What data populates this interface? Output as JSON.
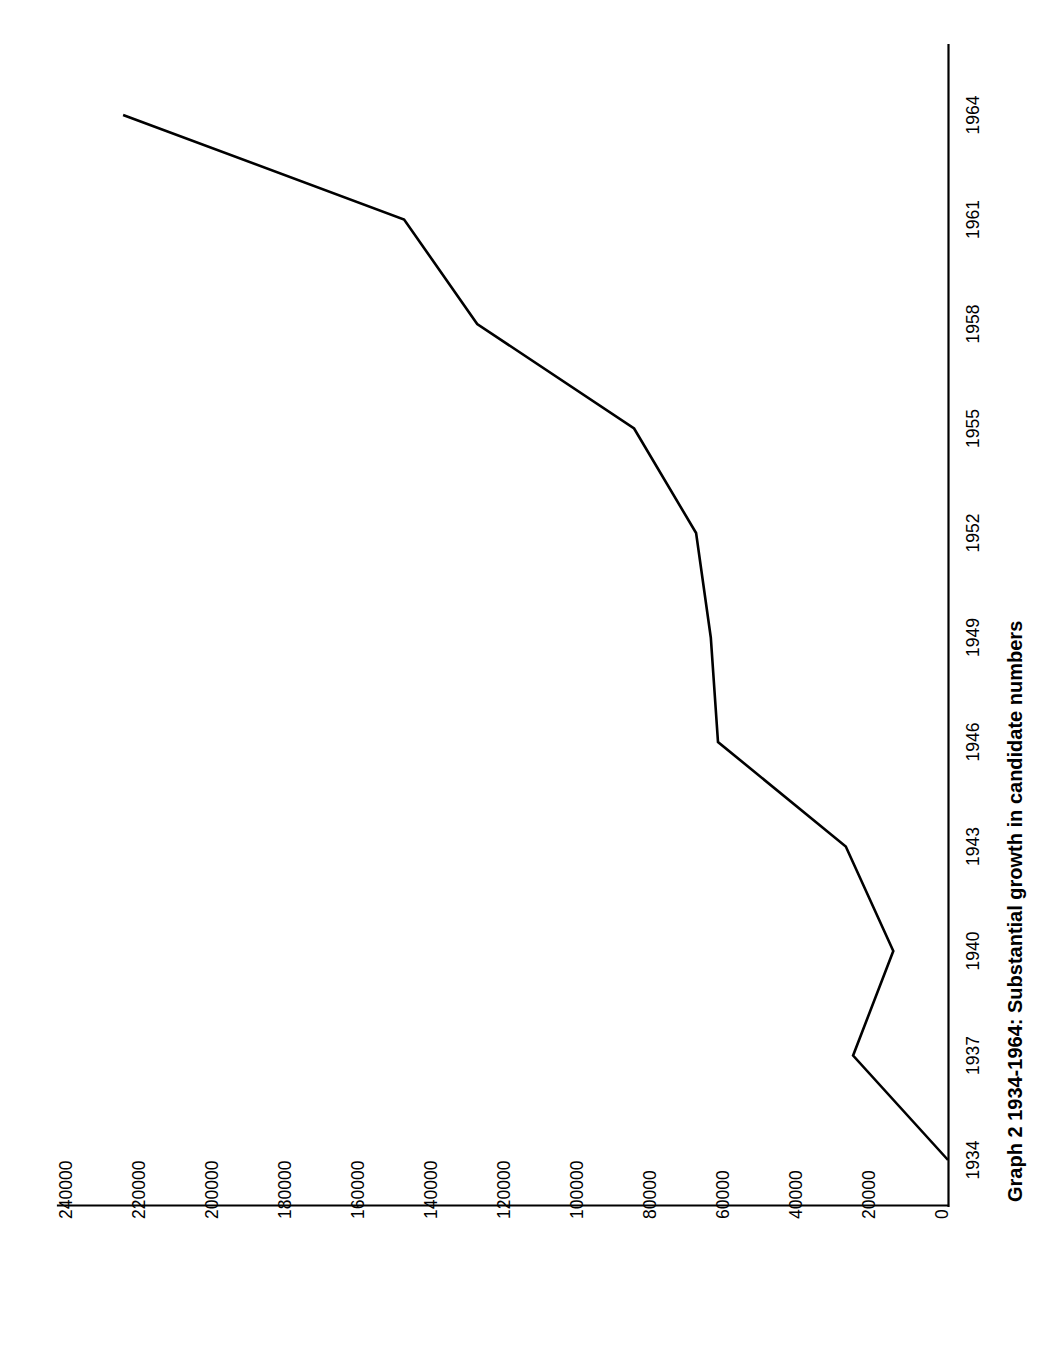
{
  "chart_data": {
    "type": "line",
    "title": "Graph 2 1934-1964: Substantial growth in candidate numbers",
    "orientation": "rotated-90-counterclockwise",
    "xlabel": "",
    "ylabel": "",
    "grid": false,
    "legend": "none",
    "x": [
      1934,
      1937,
      1940,
      1943,
      1946,
      1949,
      1952,
      1955,
      1958,
      1961,
      1964
    ],
    "categories": [
      "1934",
      "1937",
      "1940",
      "1943",
      "1946",
      "1949",
      "1952",
      "1955",
      "1958",
      "1961",
      "1964"
    ],
    "values": [
      0,
      26000,
      15000,
      28000,
      63000,
      65000,
      69000,
      86000,
      129000,
      149000,
      226000
    ],
    "xlim": [
      1934,
      1964
    ],
    "ylim": [
      0,
      240000
    ],
    "x_tick_labels": [
      "1934",
      "1937",
      "1940",
      "1943",
      "1946",
      "1949",
      "1952",
      "1955",
      "1958",
      "1961",
      "1964"
    ],
    "y_tick_labels": [
      "0",
      "20000",
      "40000",
      "60000",
      "80000",
      "100000",
      "120000",
      "140000",
      "160000",
      "180000",
      "200000",
      "220000",
      "240000"
    ],
    "y_ticks": [
      0,
      20000,
      40000,
      60000,
      80000,
      100000,
      120000,
      140000,
      160000,
      180000,
      200000,
      220000,
      240000
    ],
    "series": [
      {
        "name": "candidate numbers",
        "color": "#000000",
        "values": [
          0,
          26000,
          15000,
          28000,
          63000,
          65000,
          69000,
          86000,
          129000,
          149000,
          226000
        ]
      }
    ],
    "colors": {
      "line": "#000000",
      "axis": "#000000",
      "text": "#000000",
      "background": "#ffffff"
    }
  },
  "axis": {
    "value_axis_labels": [
      "240000",
      "220000",
      "200000",
      "180000",
      "160000",
      "140000",
      "120000",
      "100000",
      "80000",
      "60000",
      "40000",
      "20000",
      "0"
    ],
    "year_axis_labels": [
      "1964",
      "1961",
      "1958",
      "1955",
      "1952",
      "1949",
      "1946",
      "1943",
      "1940",
      "1937",
      "1934"
    ]
  },
  "caption": {
    "title": "Graph 2 1934-1964: Substantial growth in candidate numbers"
  }
}
